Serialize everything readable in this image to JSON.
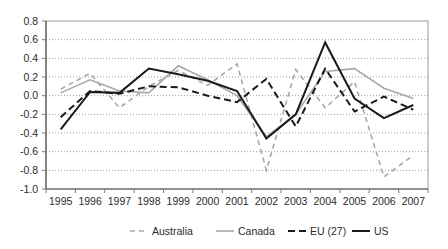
{
  "chart_data": {
    "type": "line",
    "title": "",
    "subtitle": "",
    "xlabel": "",
    "ylabel": "",
    "x": [
      1995,
      1996,
      1997,
      1998,
      1999,
      2000,
      2001,
      2002,
      2003,
      2004,
      2005,
      2006,
      2007
    ],
    "categories": [
      "1995",
      "1996",
      "1997",
      "1998",
      "1999",
      "2000",
      "2001",
      "2002",
      "2003",
      "2004",
      "2005",
      "2006",
      "2007"
    ],
    "xlim": [
      1995,
      2007
    ],
    "ylim": [
      -1.0,
      0.8
    ],
    "ytick_labels": [
      "0.8",
      "0.6",
      "0.4",
      "0.2",
      "0.0",
      "-0.2",
      "-0.4",
      "-0.6",
      "-0.8",
      "-1.0"
    ],
    "ytick_values": [
      0.8,
      0.6,
      0.4,
      0.2,
      0.0,
      -0.2,
      -0.4,
      -0.6,
      -0.8,
      -1.0
    ],
    "ytick_step": 0.2,
    "grid": {
      "horizontal": true,
      "vertical": false,
      "style": "dotted",
      "color": "#999999"
    },
    "legend": {
      "position": "bottom",
      "entries": [
        "Australia",
        "Canada",
        "EU (27)",
        "US"
      ]
    },
    "series": [
      {
        "name": "Australia",
        "color": "#a8a8a8",
        "dash": "5,4",
        "width": 1.6,
        "values": [
          0.07,
          0.24,
          -0.13,
          0.1,
          0.27,
          0.11,
          0.34,
          -0.8,
          0.28,
          -0.13,
          0.15,
          -0.87,
          -0.64
        ]
      },
      {
        "name": "Canada",
        "color": "#a8a8a8",
        "dash": "none",
        "width": 1.6,
        "values": [
          0.03,
          0.17,
          0.05,
          0.03,
          0.32,
          0.17,
          0.0,
          -0.44,
          -0.2,
          0.26,
          0.29,
          0.08,
          -0.03
        ]
      },
      {
        "name": "EU (27)",
        "color": "#1a1a1a",
        "dash": "7,4",
        "width": 2.0,
        "values": [
          -0.23,
          0.05,
          0.02,
          0.1,
          0.09,
          0.0,
          -0.07,
          0.18,
          -0.33,
          0.29,
          -0.17,
          -0.01,
          -0.15
        ]
      },
      {
        "name": "US",
        "color": "#1a1a1a",
        "dash": "none",
        "width": 2.0,
        "values": [
          -0.36,
          0.04,
          0.03,
          0.29,
          0.23,
          0.16,
          0.05,
          -0.46,
          -0.2,
          0.57,
          -0.03,
          -0.24,
          -0.1
        ]
      }
    ]
  },
  "axes": {
    "border_color": "#9a9a9a",
    "tick_color": "#7a7a7a"
  }
}
